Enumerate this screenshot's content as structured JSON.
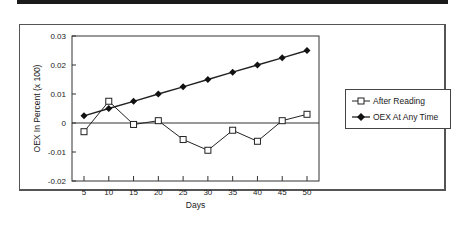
{
  "chart_data": {
    "type": "line",
    "title": "",
    "xlabel": "Days",
    "ylabel": "OEX In Percent (x 100)",
    "x": [
      5,
      10,
      15,
      20,
      25,
      30,
      35,
      40,
      45,
      50
    ],
    "xticks": [
      "5",
      "10",
      "15",
      "20",
      "25",
      "30",
      "35",
      "40",
      "45",
      "50"
    ],
    "yticks": [
      "0.03",
      "0.02",
      "0.01",
      "0",
      "-0.01",
      "-0.02"
    ],
    "ylim": [
      -0.02,
      0.03
    ],
    "grid": false,
    "legend_position": "right",
    "series": [
      {
        "name": "After Reading",
        "marker": "open-square",
        "values": [
          -0.003,
          0.0075,
          -0.0005,
          0.0008,
          -0.0057,
          -0.0094,
          -0.0025,
          -0.0063,
          0.0008,
          0.003
        ]
      },
      {
        "name": "OEX At Any Time",
        "marker": "filled-diamond",
        "values": [
          0.0025,
          0.005,
          0.0075,
          0.01,
          0.0125,
          0.015,
          0.0175,
          0.02,
          0.0225,
          0.025
        ]
      }
    ]
  },
  "legend": {
    "items": [
      {
        "label": "After Reading"
      },
      {
        "label": "OEX At Any Time"
      }
    ]
  }
}
